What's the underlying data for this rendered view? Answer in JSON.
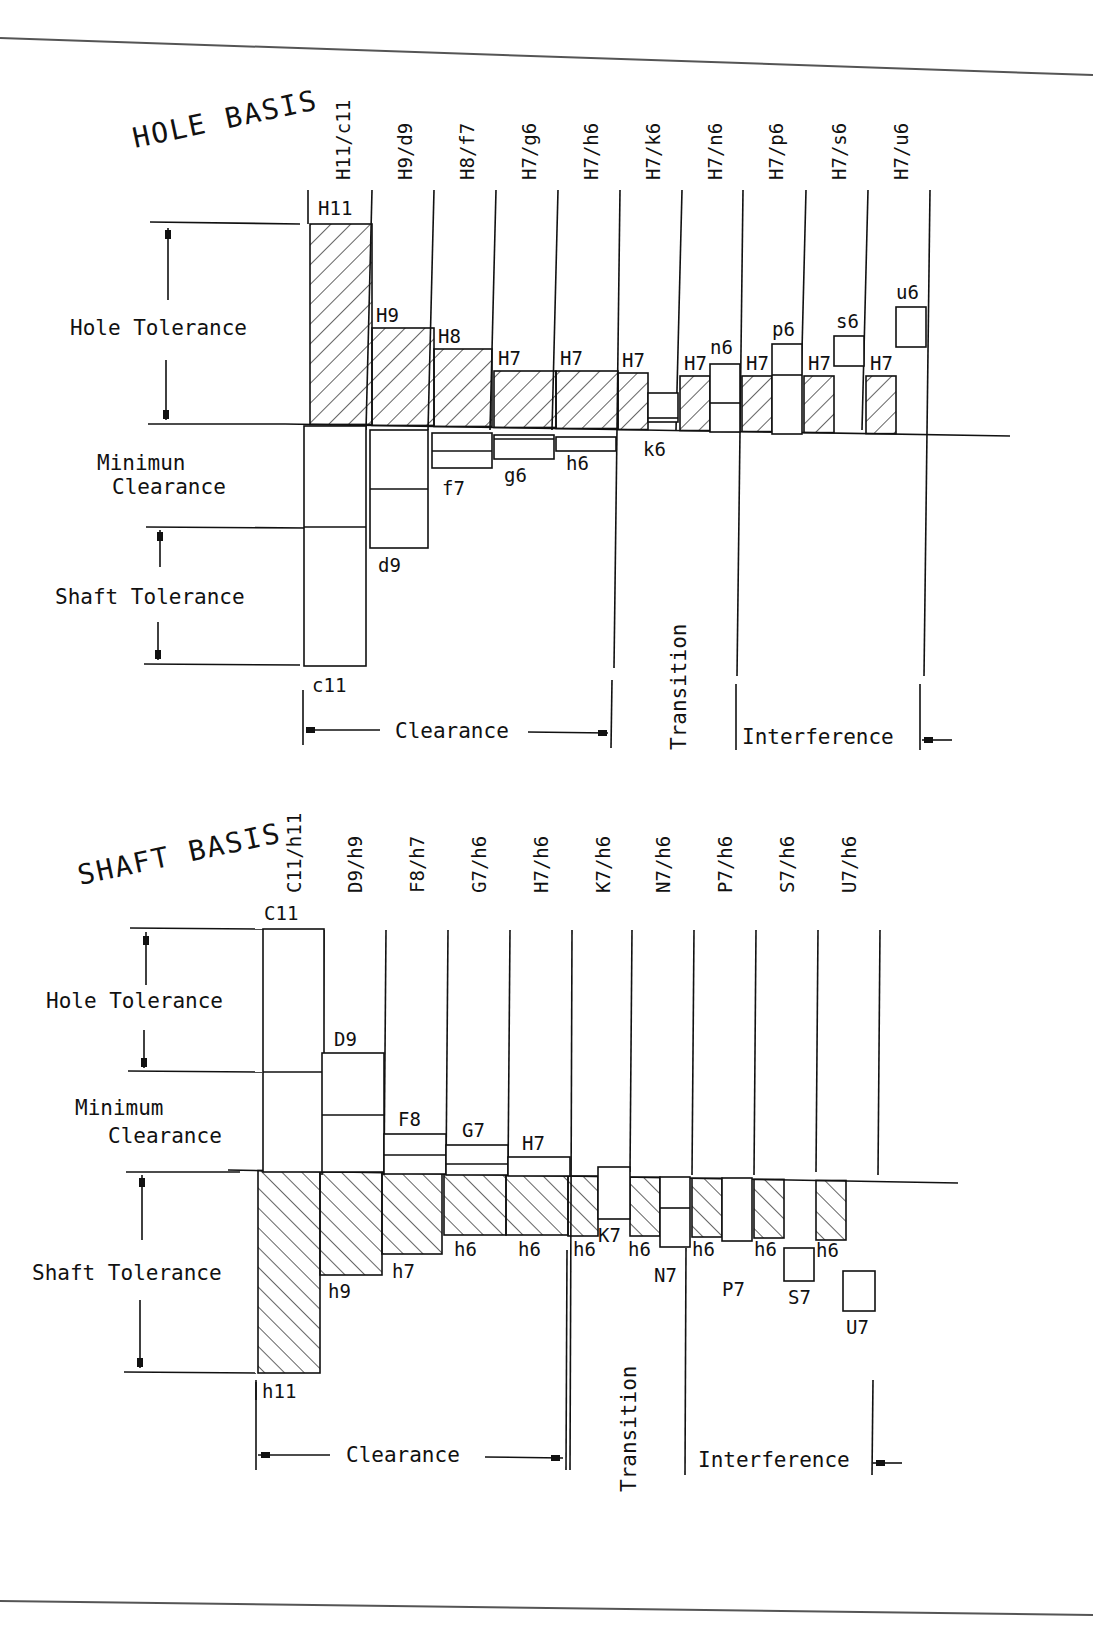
{
  "page": {
    "frame_color": "#555555",
    "line_color": "#111111",
    "background": "#ffffff"
  },
  "hole_basis": {
    "title": "HOLE BASIS",
    "side_labels": {
      "hole_tolerance": "Hole Tolerance",
      "minimum": "Minimun",
      "clearance": "Clearance",
      "shaft_tolerance": "Shaft Tolerance"
    },
    "fits": [
      "H11/c11",
      "H9/d9",
      "H8/f7",
      "H7/g6",
      "H7/h6",
      "H7/k6",
      "H7/n6",
      "H7/p6",
      "H7/s6",
      "H7/u6"
    ],
    "hole_labels": [
      "H11",
      "H9",
      "H8",
      "H7",
      "H7",
      "H7",
      "H7",
      "H7",
      "H7",
      "H7"
    ],
    "shaft_labels": [
      "c11",
      "d9",
      "f7",
      "g6",
      "h6",
      "k6",
      "n6",
      "p6",
      "s6",
      "u6"
    ],
    "categories": {
      "clearance": "Clearance",
      "transition": "Transition",
      "interference": "Interference"
    }
  },
  "shaft_basis": {
    "title": "SHAFT BASIS",
    "side_labels": {
      "hole_tolerance": "Hole Tolerance",
      "minimum": "Minimum",
      "clearance": "Clearance",
      "shaft_tolerance": "Shaft Tolerance"
    },
    "fits": [
      "C11/h11",
      "D9/h9",
      "F8/h7",
      "G7/h6",
      "H7/h6",
      "K7/h6",
      "N7/h6",
      "P7/h6",
      "S7/h6",
      "U7/h6"
    ],
    "hole_labels": [
      "C11",
      "D9",
      "F8",
      "G7",
      "H7",
      "K7",
      "N7",
      "P7",
      "S7",
      "U7"
    ],
    "shaft_labels": [
      "h11",
      "h9",
      "h7",
      "h6",
      "h6",
      "h6",
      "h6",
      "h6",
      "h6",
      "h6"
    ],
    "categories": {
      "clearance": "Clearance",
      "transition": "Transition",
      "interference": "Interference"
    }
  }
}
